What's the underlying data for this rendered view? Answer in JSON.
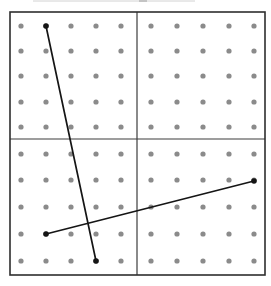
{
  "figure": {
    "canvas": {
      "width": 271,
      "height": 286,
      "background": "#ffffff"
    },
    "board": {
      "x": 10,
      "y": 12,
      "width": 255,
      "height": 263,
      "fill": "#ffffff",
      "border_color": "#2e2e2e",
      "border_width": 1.6,
      "divider_x": 137,
      "divider_y": 139,
      "divider_color": "#3c3c3c",
      "divider_width": 1.2
    },
    "dots": {
      "columns": [
        21,
        46,
        71,
        96,
        121,
        151,
        177,
        203,
        229,
        254
      ],
      "rows": [
        26,
        51,
        76,
        102,
        127,
        154,
        180,
        207,
        234,
        261
      ],
      "radius": 2.6,
      "color": "#8b8b8b"
    },
    "segments": [
      {
        "name": "segment-1-steep",
        "from_col": 2,
        "from_row": 1,
        "to_col": 4,
        "to_row": 10,
        "x1": 46,
        "y1": 26,
        "x2": 96,
        "y2": 261
      },
      {
        "name": "segment-2-shallow",
        "from_col": 2,
        "from_row": 9,
        "to_col": 10,
        "to_row": 7,
        "x1": 46,
        "y1": 234,
        "x2": 254,
        "y2": 181
      }
    ],
    "segment_style": {
      "color": "#151515",
      "width": 1.7,
      "endpoint_radius": 2.8
    },
    "top_crop_artifact": {
      "lines": [
        {
          "x1": 33,
          "x2": 195,
          "y": 1,
          "color": "#d2d2d2"
        },
        {
          "x1": 139,
          "x2": 147,
          "y": 1,
          "color": "#9f9f9f"
        }
      ]
    }
  }
}
